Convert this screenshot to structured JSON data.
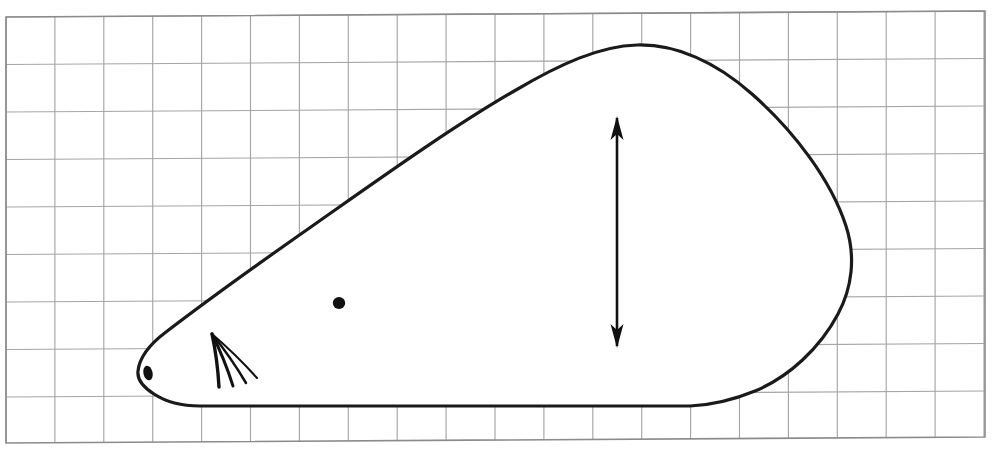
{
  "figure": {
    "caption": "",
    "colors": {
      "paper": "#ffffff",
      "grid_line": "#9e9e9e",
      "grid_border": "#8d8d8d",
      "ink": "#1a1a1a",
      "fill": "#ffffff"
    },
    "grid": {
      "label": "graph-paper grid",
      "columns": 20,
      "rows": 9,
      "cell_width_px": 48.9,
      "cell_height_px": 47.5,
      "left_px": 6,
      "top_px": 17,
      "right_px": 985,
      "bottom_px": 443,
      "tilt_degrees": -0.35
    },
    "outline": {
      "label": "body-outline",
      "nose_tip": [
        138,
        371
      ],
      "apex": [
        636,
        45
      ],
      "rightmost": [
        851,
        255
      ],
      "belly_y": 406,
      "belly_start_x": 168,
      "belly_end_x": 712,
      "stroke_width": 3.2
    },
    "eye": {
      "label": "eye-dot",
      "cx": 339,
      "cy": 303,
      "rx": 6.2,
      "ry": 6.0
    },
    "nostril": {
      "label": "nostril-dot",
      "cx": 148,
      "cy": 373,
      "rx": 4.6,
      "ry": 7.4,
      "rotation": -12
    },
    "whiskers": {
      "label": "whisker-fan",
      "origin": [
        212,
        334
      ],
      "count": 4,
      "tips": [
        [
          219,
          387
        ],
        [
          233,
          386
        ],
        [
          246,
          383
        ],
        [
          257,
          378
        ]
      ]
    },
    "arrow": {
      "label": "height-dimension-arrow",
      "x": 617,
      "top_y": 118,
      "bottom_y": 346,
      "double_headed": true,
      "head_length": 20,
      "head_width": 13,
      "shaft_width": 2.6,
      "measures": "vertical body height"
    }
  }
}
